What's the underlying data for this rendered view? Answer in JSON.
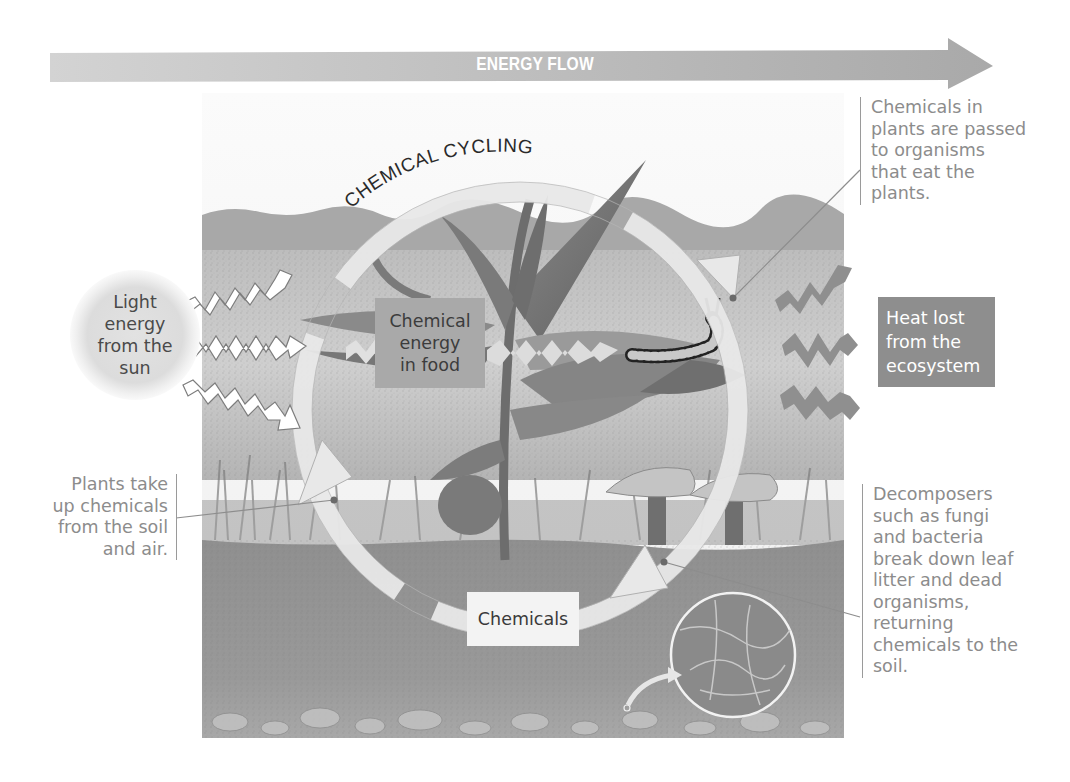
{
  "title_arrow": {
    "label": "ENERGY FLOW",
    "color": "#b9b9b9"
  },
  "cycle": {
    "label": "CHEMICAL CYCLING",
    "arrow_color": "#e6e6e6"
  },
  "sun": {
    "label_lines": [
      "Light",
      "energy",
      "from the",
      "sun"
    ]
  },
  "food_box": {
    "label_lines": [
      "Chemical",
      "energy",
      "in food"
    ]
  },
  "chemicals_box": {
    "label": "Chemicals"
  },
  "heat_box": {
    "label_lines": [
      "Heat lost",
      "from the",
      "ecosystem"
    ],
    "color": "#8e8e8e"
  },
  "callouts": {
    "consumers": {
      "lines": [
        "Chemicals in",
        "plants are passed",
        "to organisms",
        "that eat the",
        "plants."
      ]
    },
    "plants_uptake": {
      "lines": [
        "Plants take",
        "up chemicals",
        "from the soil",
        "and air."
      ]
    },
    "decomposers": {
      "lines": [
        "Decomposers",
        "such as fungi",
        "and bacteria",
        "break down leaf",
        "litter and dead",
        "organisms,",
        "returning",
        "chemicals to the",
        "soil."
      ]
    }
  },
  "illustration": {
    "elements": [
      "sky",
      "distant-hills",
      "meadow",
      "plant",
      "caterpillar",
      "mushrooms",
      "soil",
      "fungal-hyphae-magnifier",
      "light-rays",
      "heat-rays"
    ]
  }
}
